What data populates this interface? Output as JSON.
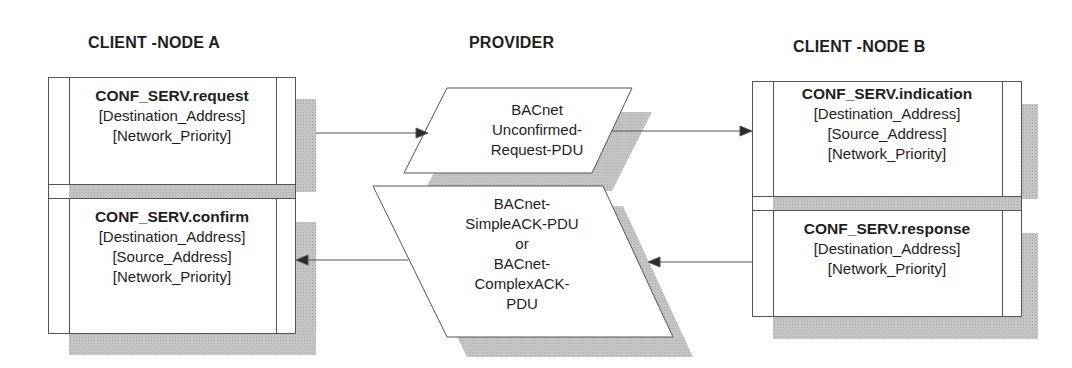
{
  "columns": {
    "client_a": {
      "title": "CLIENT -NODE A"
    },
    "provider": {
      "title": "PROVIDER"
    },
    "client_b": {
      "title": "CLIENT -NODE B"
    }
  },
  "client_a": {
    "request": {
      "primitive": "CONF_SERV.request",
      "params": [
        "[Destination_Address]",
        "[Network_Priority]"
      ]
    },
    "confirm": {
      "primitive": "CONF_SERV.confirm",
      "params": [
        "[Destination_Address]",
        "[Source_Address]",
        "[Network_Priority]"
      ]
    }
  },
  "provider": {
    "request_pdu": {
      "lines": [
        "BACnet",
        "Unconfirmed-",
        "Request-PDU"
      ]
    },
    "ack_pdu": {
      "lines": [
        "BACnet-",
        "SimpleACK-PDU",
        "or",
        "BACnet-",
        "ComplexACK-",
        "PDU"
      ]
    }
  },
  "client_b": {
    "indication": {
      "primitive": "CONF_SERV.indication",
      "params": [
        "[Destination_Address]",
        "[Source_Address]",
        "[Network_Priority]"
      ]
    },
    "response": {
      "primitive": "CONF_SERV.response",
      "params": [
        "[Destination_Address]",
        "[Network_Priority]"
      ]
    }
  },
  "flows": [
    {
      "from": "CONF_SERV.request",
      "to": "BACnet Unconfirmed-Request-PDU",
      "direction": "right"
    },
    {
      "from": "BACnet Unconfirmed-Request-PDU",
      "to": "CONF_SERV.indication",
      "direction": "right"
    },
    {
      "from": "CONF_SERV.response",
      "to": "BACnet-SimpleACK-PDU or BACnet-ComplexACK-PDU",
      "direction": "left"
    },
    {
      "from": "BACnet-SimpleACK-PDU or BACnet-ComplexACK-PDU",
      "to": "CONF_SERV.confirm",
      "direction": "left"
    }
  ],
  "colors": {
    "line": "#555555",
    "shadow": "#c4c4c4",
    "text": "#1e1e1e",
    "background": "#ffffff"
  }
}
